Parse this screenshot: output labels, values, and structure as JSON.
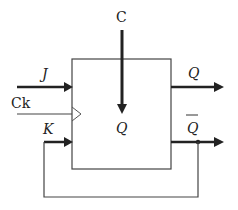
{
  "diagram": {
    "type": "JK flip-flop block diagram",
    "block": {
      "internal_label": "Q"
    },
    "inputs": {
      "top": "C",
      "j": "J",
      "clock": "Ck",
      "k": "K"
    },
    "outputs": {
      "q": "Q",
      "q_bar": "Q"
    },
    "connections": [
      "C enters block from top, arrow pointing down to internal Q",
      "J arrow into block",
      "Ck line into block with clock triangle",
      "K arrow into block",
      "Q arrow out of block",
      "Q-bar arrow out of block with junction dot",
      "Feedback line from Q-bar junction down, left and up to K input"
    ],
    "colors": {
      "line": "#444444",
      "arrow": "#222222",
      "background": "#ffffff"
    }
  }
}
